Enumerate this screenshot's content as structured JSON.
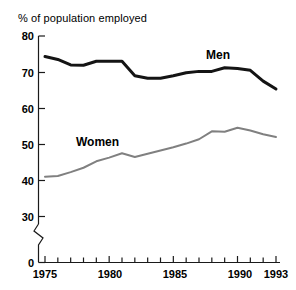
{
  "chart_data": {
    "type": "line",
    "title": "% of population employed",
    "xlabel": "",
    "ylabel": "",
    "xlim": [
      1975,
      1993
    ],
    "ylim": [
      30,
      80
    ],
    "y_axis_break": true,
    "y_axis_break_note": "axis broken between 0 and 30",
    "grid": false,
    "legend_position": "inline-labels",
    "y_ticks": [
      "80",
      "70",
      "60",
      "50",
      "40",
      "30",
      "0"
    ],
    "y_tick_values": [
      80,
      70,
      60,
      50,
      40,
      30,
      0
    ],
    "x_ticks": [
      "1975",
      "1980",
      "1985",
      "1990",
      "1993"
    ],
    "x_tick_values": [
      1975,
      1980,
      1985,
      1990,
      1993
    ],
    "x_minor_ticks": [
      1976,
      1977,
      1978,
      1979,
      1981,
      1982,
      1983,
      1984,
      1986,
      1987,
      1988,
      1989,
      1991,
      1992
    ],
    "x": [
      1975,
      1976,
      1977,
      1978,
      1979,
      1980,
      1981,
      1982,
      1983,
      1984,
      1985,
      1986,
      1987,
      1988,
      1989,
      1990,
      1991,
      1992,
      1993
    ],
    "series": [
      {
        "name": "Men",
        "color": "#141414",
        "values": [
          74.3,
          73.5,
          72.0,
          71.9,
          73.0,
          73.0,
          73.0,
          69.0,
          68.3,
          68.3,
          69.0,
          69.8,
          70.2,
          70.2,
          71.2,
          71.0,
          70.5,
          67.5,
          65.3
        ]
      },
      {
        "name": "Women",
        "color": "#808080",
        "values": [
          41.0,
          41.2,
          42.3,
          43.5,
          45.3,
          46.3,
          47.5,
          46.5,
          47.4,
          48.3,
          49.2,
          50.2,
          51.4,
          53.6,
          53.5,
          54.6,
          53.8,
          52.8,
          52.0
        ]
      }
    ],
    "annotations": [
      {
        "text": "Men",
        "near_x": 1989,
        "near_y": 76
      },
      {
        "text": "Women",
        "near_x": 1980,
        "near_y": 52
      }
    ]
  }
}
